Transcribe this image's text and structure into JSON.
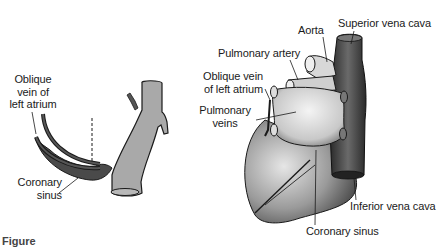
{
  "figure": {
    "caption_partial": "Figure",
    "left_panel": {
      "labels": {
        "oblique_vein_line1": "Oblique",
        "oblique_vein_line2": "vein of",
        "oblique_vein_line3": "left atrium",
        "coronary_sinus_line1": "Coronary",
        "coronary_sinus_line2": "sinus"
      }
    },
    "right_panel": {
      "labels": {
        "aorta": "Aorta",
        "superior_vena_cava": "Superior vena cava",
        "pulmonary_artery": "Pulmonary artery",
        "oblique_vein_line1": "Oblique vein",
        "oblique_vein_line2": "of left atrium",
        "pulmonary_veins_line1": "Pulmonary",
        "pulmonary_veins_line2": "veins",
        "inferior_vena_cava": "Inferior vena cava",
        "coronary_sinus": "Coronary sinus"
      }
    },
    "colors": {
      "outline": "#1a1a1a",
      "vessel_gray": "#a9a9a9",
      "sinus_dark": "#4a4a4a",
      "heart_shade": "#8a8a8a"
    }
  }
}
